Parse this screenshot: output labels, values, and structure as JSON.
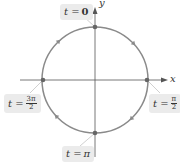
{
  "diagram": {
    "type": "unit-circle-parametrization",
    "center": [
      95,
      80
    ],
    "radius": 53,
    "colors": {
      "circle": "#8a8a8a",
      "axis": "#555555",
      "point": "#666666",
      "label_bg": "#ebebeb",
      "text": "#333333"
    },
    "axes": {
      "x_label": "x",
      "y_label": "y"
    },
    "direction": "clockwise",
    "points": [
      {
        "position": "top",
        "label_prefix": "t =",
        "value": "0"
      },
      {
        "position": "right",
        "label_prefix": "t =",
        "value_num": "π",
        "value_den": "2"
      },
      {
        "position": "bottom",
        "label_prefix": "t =",
        "value": "π"
      },
      {
        "position": "left",
        "label_prefix": "t =",
        "value_num": "3π",
        "value_den": "2"
      }
    ]
  }
}
